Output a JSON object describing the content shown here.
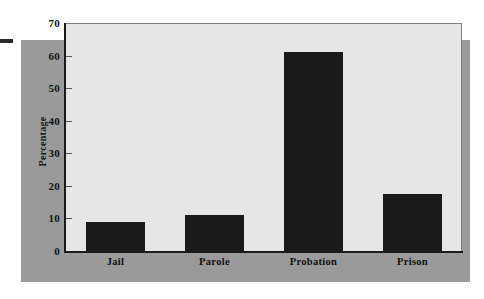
{
  "chart_data": {
    "type": "bar",
    "title": "",
    "subtitle": "",
    "xlabel": "",
    "ylabel": "Percentage",
    "categories": [
      "Jail",
      "Parole",
      "Probation",
      "Prison"
    ],
    "values": [
      9,
      11,
      61,
      17.5
    ],
    "ylim": [
      0,
      70
    ],
    "y_ticks": [
      0,
      10,
      20,
      30,
      40,
      50,
      60,
      70
    ],
    "y_tick_labels": [
      "0",
      "10",
      "20",
      "30",
      "40",
      "50",
      "60",
      "70"
    ],
    "grid": false,
    "legend": null,
    "legend_position": "none",
    "annotations": [],
    "series": [
      {
        "name": "Percentage",
        "values": [
          9,
          11,
          61,
          17.5
        ]
      }
    ]
  },
  "colors": {
    "bar_fill": "#1a1a1a",
    "plot_background": "#e6e6e6",
    "panel_background": "#9a9a9a",
    "page_background": "#ffffff",
    "axis_line": "#1a1a1a",
    "text": "#111111"
  }
}
